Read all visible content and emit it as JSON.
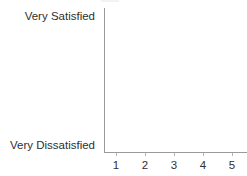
{
  "chart_data": {
    "type": "scatter",
    "title": "",
    "subtitle": "",
    "xlabel": "",
    "ylabel": "",
    "x": [],
    "values": [],
    "series": [],
    "annotations": [],
    "legend": [],
    "legend_position": "none",
    "grid": false,
    "x_tick_labels": [
      "1",
      "2",
      "3",
      "4",
      "5"
    ],
    "xlim": [
      1,
      5
    ],
    "y_category_labels": {
      "top": "Very Satisfied",
      "bottom": "Very Dissatisfied"
    },
    "y_tick_labels": [
      "Very Dissatisfied",
      "Very Satisfied"
    ],
    "ylim": [
      "Very Dissatisfied",
      "Very Satisfied"
    ],
    "note": "empty plot area - no data series drawn"
  },
  "axes": {
    "axis_color": "#9b9b9b",
    "tick_color": "#b4b4b4",
    "text_color": "#2f2f2f",
    "background": "#ffffff"
  }
}
